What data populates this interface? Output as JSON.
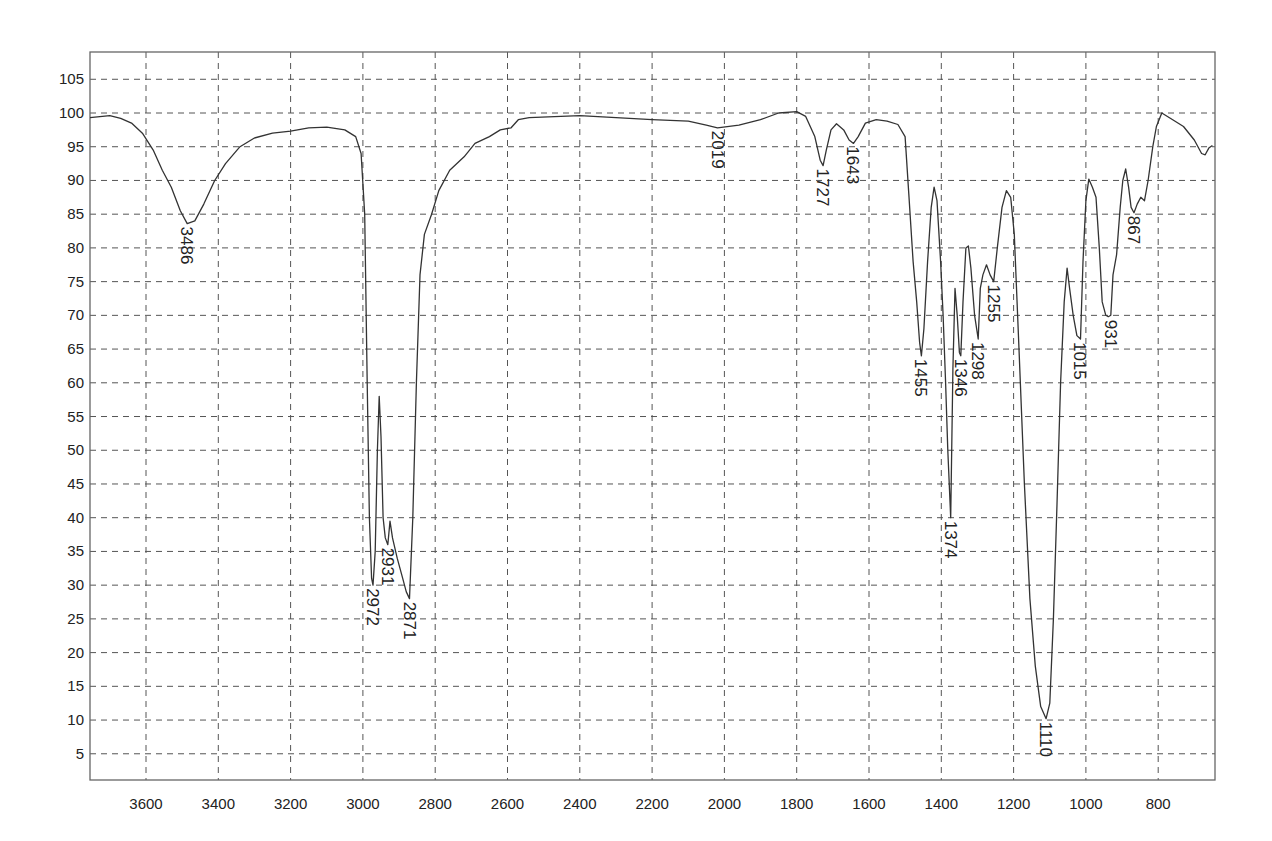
{
  "chart_data": {
    "type": "line",
    "title": "",
    "xlabel": "",
    "ylabel": "",
    "x_reversed": true,
    "xlim": [
      3755,
      650
    ],
    "ylim": [
      0,
      109
    ],
    "grid": true,
    "legend": null,
    "x_ticks": [
      3600,
      3400,
      3200,
      3000,
      2800,
      2600,
      2400,
      2200,
      2000,
      1800,
      1600,
      1400,
      1200,
      1000,
      800
    ],
    "y_ticks": [
      5,
      10,
      15,
      20,
      25,
      30,
      35,
      40,
      45,
      50,
      55,
      60,
      65,
      70,
      75,
      80,
      85,
      90,
      95,
      100,
      105
    ],
    "series": [
      {
        "name": "IR transmittance spectrum",
        "points": [
          [
            3755,
            99.3
          ],
          [
            3700,
            99.6
          ],
          [
            3670,
            99.2
          ],
          [
            3640,
            98.5
          ],
          [
            3610,
            97.0
          ],
          [
            3580,
            94.5
          ],
          [
            3555,
            91.5
          ],
          [
            3530,
            89.0
          ],
          [
            3505,
            85.5
          ],
          [
            3486,
            83.6
          ],
          [
            3465,
            84.0
          ],
          [
            3440,
            86.5
          ],
          [
            3410,
            90.0
          ],
          [
            3380,
            92.5
          ],
          [
            3340,
            95.0
          ],
          [
            3300,
            96.3
          ],
          [
            3250,
            97.0
          ],
          [
            3200,
            97.3
          ],
          [
            3150,
            97.8
          ],
          [
            3100,
            97.9
          ],
          [
            3050,
            97.5
          ],
          [
            3020,
            96.5
          ],
          [
            3005,
            94.0
          ],
          [
            2995,
            85.0
          ],
          [
            2988,
            60.0
          ],
          [
            2982,
            40.0
          ],
          [
            2976,
            31.0
          ],
          [
            2972,
            30.0
          ],
          [
            2966,
            35.0
          ],
          [
            2960,
            50.0
          ],
          [
            2955,
            58.0
          ],
          [
            2950,
            52.0
          ],
          [
            2944,
            40.0
          ],
          [
            2938,
            37.0
          ],
          [
            2931,
            36.0
          ],
          [
            2925,
            39.5
          ],
          [
            2918,
            37.0
          ],
          [
            2905,
            34.0
          ],
          [
            2890,
            31.0
          ],
          [
            2880,
            29.0
          ],
          [
            2871,
            28.0
          ],
          [
            2862,
            40.0
          ],
          [
            2852,
            60.0
          ],
          [
            2842,
            76.0
          ],
          [
            2830,
            82.0
          ],
          [
            2810,
            85.0
          ],
          [
            2790,
            88.5
          ],
          [
            2760,
            91.5
          ],
          [
            2720,
            93.5
          ],
          [
            2690,
            95.5
          ],
          [
            2650,
            96.5
          ],
          [
            2620,
            97.5
          ],
          [
            2590,
            97.8
          ],
          [
            2570,
            99.0
          ],
          [
            2540,
            99.3
          ],
          [
            2400,
            99.6
          ],
          [
            2300,
            99.3
          ],
          [
            2200,
            99.0
          ],
          [
            2100,
            98.8
          ],
          [
            2050,
            98.2
          ],
          [
            2019,
            97.8
          ],
          [
            1960,
            98.2
          ],
          [
            1900,
            99.0
          ],
          [
            1850,
            100.0
          ],
          [
            1800,
            100.2
          ],
          [
            1775,
            99.5
          ],
          [
            1750,
            96.5
          ],
          [
            1735,
            93.0
          ],
          [
            1727,
            92.2
          ],
          [
            1718,
            94.5
          ],
          [
            1705,
            97.5
          ],
          [
            1690,
            98.4
          ],
          [
            1670,
            97.5
          ],
          [
            1655,
            96.0
          ],
          [
            1643,
            95.5
          ],
          [
            1630,
            96.5
          ],
          [
            1610,
            98.5
          ],
          [
            1580,
            99.0
          ],
          [
            1550,
            98.8
          ],
          [
            1520,
            98.3
          ],
          [
            1500,
            96.5
          ],
          [
            1490,
            88.0
          ],
          [
            1478,
            78.0
          ],
          [
            1468,
            72.0
          ],
          [
            1460,
            66.0
          ],
          [
            1455,
            64.0
          ],
          [
            1448,
            68.0
          ],
          [
            1438,
            78.0
          ],
          [
            1428,
            86.0
          ],
          [
            1420,
            89.0
          ],
          [
            1412,
            87.0
          ],
          [
            1402,
            78.0
          ],
          [
            1395,
            70.0
          ],
          [
            1388,
            60.0
          ],
          [
            1382,
            50.0
          ],
          [
            1374,
            40.0
          ],
          [
            1368,
            62.0
          ],
          [
            1362,
            74.0
          ],
          [
            1356,
            70.0
          ],
          [
            1350,
            64.5
          ],
          [
            1346,
            64.0
          ],
          [
            1340,
            72.0
          ],
          [
            1332,
            80.0
          ],
          [
            1325,
            80.3
          ],
          [
            1318,
            77.0
          ],
          [
            1308,
            70.0
          ],
          [
            1298,
            66.5
          ],
          [
            1292,
            74.0
          ],
          [
            1285,
            76.0
          ],
          [
            1275,
            77.5
          ],
          [
            1265,
            76.0
          ],
          [
            1255,
            75.0
          ],
          [
            1245,
            80.0
          ],
          [
            1232,
            86.0
          ],
          [
            1220,
            88.5
          ],
          [
            1208,
            87.5
          ],
          [
            1198,
            82.0
          ],
          [
            1185,
            65.0
          ],
          [
            1170,
            45.0
          ],
          [
            1155,
            28.0
          ],
          [
            1140,
            18.0
          ],
          [
            1125,
            12.0
          ],
          [
            1110,
            10.2
          ],
          [
            1100,
            12.5
          ],
          [
            1090,
            25.0
          ],
          [
            1080,
            42.0
          ],
          [
            1070,
            60.0
          ],
          [
            1060,
            72.0
          ],
          [
            1052,
            77.0
          ],
          [
            1045,
            74.0
          ],
          [
            1035,
            70.0
          ],
          [
            1025,
            67.0
          ],
          [
            1015,
            66.5
          ],
          [
            1008,
            78.0
          ],
          [
            1000,
            87.0
          ],
          [
            992,
            90.2
          ],
          [
            982,
            89.0
          ],
          [
            972,
            87.5
          ],
          [
            963,
            80.0
          ],
          [
            955,
            72.0
          ],
          [
            945,
            70.0
          ],
          [
            938,
            69.8
          ],
          [
            931,
            70.0
          ],
          [
            925,
            76.0
          ],
          [
            915,
            79.0
          ],
          [
            905,
            86.0
          ],
          [
            898,
            90.0
          ],
          [
            890,
            91.7
          ],
          [
            882,
            89.0
          ],
          [
            875,
            86.0
          ],
          [
            867,
            85.2
          ],
          [
            858,
            86.5
          ],
          [
            848,
            87.5
          ],
          [
            838,
            87.0
          ],
          [
            828,
            90.0
          ],
          [
            815,
            95.0
          ],
          [
            805,
            98.0
          ],
          [
            790,
            100.0
          ],
          [
            760,
            99.0
          ],
          [
            730,
            98.0
          ],
          [
            700,
            96.0
          ],
          [
            680,
            94.0
          ],
          [
            670,
            93.8
          ],
          [
            660,
            94.8
          ],
          [
            650,
            95.2
          ]
        ]
      }
    ],
    "annotations": [
      {
        "label": "3486",
        "x": 3486,
        "y": 83.6
      },
      {
        "label": "2972",
        "x": 2972,
        "y": 30.0
      },
      {
        "label": "2931",
        "x": 2931,
        "y": 36.0
      },
      {
        "label": "2871",
        "x": 2871,
        "y": 28.0
      },
      {
        "label": "2019",
        "x": 2019,
        "y": 97.8
      },
      {
        "label": "1727",
        "x": 1727,
        "y": 92.2
      },
      {
        "label": "1643",
        "x": 1643,
        "y": 95.5
      },
      {
        "label": "1455",
        "x": 1455,
        "y": 64.0
      },
      {
        "label": "1374",
        "x": 1374,
        "y": 40.0
      },
      {
        "label": "1346",
        "x": 1346,
        "y": 64.0
      },
      {
        "label": "1298",
        "x": 1298,
        "y": 66.5
      },
      {
        "label": "1255",
        "x": 1255,
        "y": 75.0
      },
      {
        "label": "1110",
        "x": 1110,
        "y": 10.2
      },
      {
        "label": "1015",
        "x": 1015,
        "y": 66.5
      },
      {
        "label": "931",
        "x": 931,
        "y": 69.8
      },
      {
        "label": "867",
        "x": 867,
        "y": 85.2
      }
    ]
  },
  "colors": {
    "background": "#ffffff",
    "trace": "#333333",
    "grid": "#555555",
    "frame": "#666666",
    "text": "#222222"
  }
}
